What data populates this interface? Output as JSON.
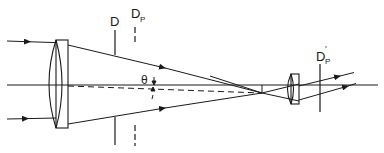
{
  "diagram": {
    "type": "optical-ray-diagram",
    "labels": {
      "stop_D": "D",
      "pupil_Dp_main": "D",
      "pupil_Dp_sub": "P",
      "angle": "θ",
      "exit_pupil_main": "D",
      "exit_pupil_sub": "P",
      "exit_pupil_prime": "′"
    },
    "elements": [
      {
        "id": "objective-lens",
        "kind": "lens",
        "shape": "biconvex-with-plate"
      },
      {
        "id": "aperture-stop-D",
        "kind": "stop",
        "style": "solid"
      },
      {
        "id": "entrance-pupil-Dp",
        "kind": "pupil",
        "style": "dashed"
      },
      {
        "id": "focal-point",
        "kind": "focus"
      },
      {
        "id": "eyepiece-lens",
        "kind": "lens",
        "shape": "plano-convex"
      },
      {
        "id": "exit-pupil-Dp-prime",
        "kind": "pupil",
        "style": "solid"
      }
    ],
    "colors": {
      "stroke": "#1a1a1a",
      "background": "#ffffff"
    }
  }
}
